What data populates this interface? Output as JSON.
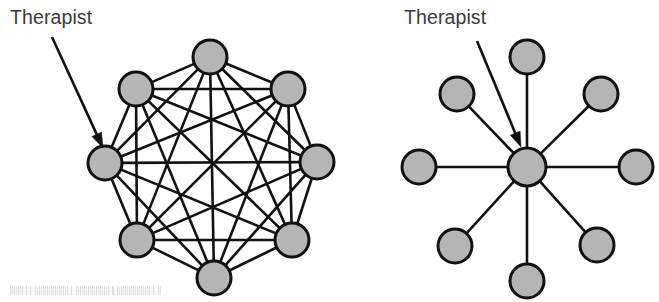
{
  "figure": {
    "background_color": "#ffffff",
    "width": 659,
    "height": 302,
    "node_fill_color": "#b5b5b5",
    "node_stroke_color": "#111111",
    "line_color": "#111111",
    "label_color": "#3a3a3a"
  },
  "left_diagram": {
    "name": "complete-network",
    "label": "Therapist",
    "label_x": 10,
    "label_y": 24,
    "arrow": {
      "x1": 52,
      "y1": 37,
      "x2": 103,
      "y2": 148
    },
    "center": {
      "x": 212,
      "y": 167
    },
    "node_radius": 17,
    "node_stroke_width": 3,
    "edge_width": 2.6,
    "nodes": [
      {
        "id": "n0",
        "name": "therapist-node",
        "x": 210,
        "y": 57,
        "role": "member"
      },
      {
        "id": "n1",
        "name": "member-node",
        "x": 288,
        "y": 89,
        "role": "member"
      },
      {
        "id": "n2",
        "name": "member-node",
        "x": 317,
        "y": 162,
        "role": "member"
      },
      {
        "id": "n3",
        "name": "member-node",
        "x": 292,
        "y": 240,
        "role": "member"
      },
      {
        "id": "n4",
        "name": "member-node",
        "x": 214,
        "y": 278,
        "role": "member"
      },
      {
        "id": "n5",
        "name": "member-node",
        "x": 137,
        "y": 240,
        "role": "member"
      },
      {
        "id": "n6",
        "name": "therapist-node",
        "x": 105,
        "y": 163,
        "role": "therapist"
      },
      {
        "id": "n7",
        "name": "member-node",
        "x": 136,
        "y": 89,
        "role": "member"
      }
    ],
    "edges_type": "complete",
    "node_count": 8,
    "edge_count": 28
  },
  "right_diagram": {
    "name": "star-network",
    "label": "Therapist",
    "label_x": 404,
    "label_y": 24,
    "arrow": {
      "x1": 477,
      "y1": 41,
      "x2": 521,
      "y2": 147
    },
    "hub": {
      "id": "hub",
      "name": "therapist-node",
      "x": 527,
      "y": 167,
      "r": 19,
      "role": "therapist"
    },
    "node_radius": 17,
    "node_stroke_width": 3,
    "edge_width": 2.6,
    "nodes": [
      {
        "id": "p0",
        "name": "member-node",
        "x": 527,
        "y": 57,
        "role": "member"
      },
      {
        "id": "p1",
        "name": "member-node",
        "x": 601,
        "y": 94,
        "role": "member"
      },
      {
        "id": "p2",
        "name": "member-node",
        "x": 636,
        "y": 167,
        "role": "member"
      },
      {
        "id": "p3",
        "name": "member-node",
        "x": 597,
        "y": 245,
        "role": "member"
      },
      {
        "id": "p4",
        "name": "member-node",
        "x": 527,
        "y": 281,
        "role": "member"
      },
      {
        "id": "p5",
        "name": "member-node",
        "x": 455,
        "y": 246,
        "role": "member"
      },
      {
        "id": "p6",
        "name": "member-node",
        "x": 419,
        "y": 167,
        "role": "member"
      },
      {
        "id": "p7",
        "name": "member-node",
        "x": 457,
        "y": 94,
        "role": "member"
      }
    ],
    "edges_type": "star",
    "node_count": 9,
    "edge_count": 8
  },
  "scan_artifact": {
    "name": "scan-artifact-bar",
    "x": 10,
    "y": 286,
    "width": 152,
    "height": 9
  }
}
